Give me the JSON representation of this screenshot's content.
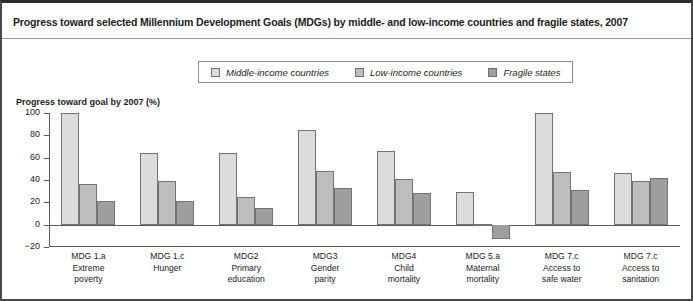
{
  "title": "Progress toward selected Millennium Development Goals (MDGs) by middle- and low-income countries and fragile states, 2007",
  "axis_title": "Progress toward goal by 2007 (%)",
  "legend": {
    "items": [
      {
        "label": "Middle-income countries",
        "color": "#dcdcdc"
      },
      {
        "label": "Low-income countries",
        "color": "#bdbdbd"
      },
      {
        "label": "Fragile states",
        "color": "#9e9e9e"
      }
    ]
  },
  "chart_data": {
    "type": "bar",
    "title": "Progress toward selected Millennium Development Goals (MDGs) by middle- and low-income countries and fragile states, 2007",
    "xlabel": "",
    "ylabel": "Progress toward goal by 2007 (%)",
    "ylim": [
      -20,
      100
    ],
    "yticks": [
      100,
      80,
      60,
      40,
      20,
      0,
      -20
    ],
    "ytick_labels": [
      "100",
      "80",
      "60",
      "40",
      "20",
      "0",
      "−20"
    ],
    "grid": false,
    "legend_position": "top-center",
    "categories": [
      "MDG 1.a Extreme poverty",
      "MDG 1.c Hunger",
      "MDG2 Primary education",
      "MDG3 Gender parity",
      "MDG4 Child mortality",
      "MDG 5.a Maternal mortality",
      "MDG 7.c Access to safe water",
      "MDG 7.c Access to sanitation"
    ],
    "category_lines": [
      [
        "MDG 1.a",
        "Extreme",
        "poverty"
      ],
      [
        "MDG 1.c",
        "Hunger"
      ],
      [
        "MDG2",
        "Primary",
        "education"
      ],
      [
        "MDG3",
        "Gender",
        "parity"
      ],
      [
        "MDG4",
        "Child",
        "mortality"
      ],
      [
        "MDG 5.a",
        "Maternal",
        "mortality"
      ],
      [
        "MDG 7.c",
        "Access to",
        "safe water"
      ],
      [
        "MDG 7.c",
        "Access to",
        "sanitation"
      ]
    ],
    "series": [
      {
        "name": "Middle-income countries",
        "color": "#dcdcdc",
        "values": [
          100,
          64,
          64,
          85,
          66,
          29,
          100,
          46
        ]
      },
      {
        "name": "Low-income countries",
        "color": "#bdbdbd",
        "values": [
          36,
          39,
          25,
          48,
          41,
          1,
          47,
          39
        ]
      },
      {
        "name": "Fragile states",
        "color": "#9e9e9e",
        "values": [
          21,
          21,
          15,
          33,
          28,
          -13,
          31,
          42
        ]
      }
    ]
  }
}
